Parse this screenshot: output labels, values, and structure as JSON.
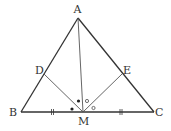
{
  "diagram": {
    "labels": {
      "A": "A",
      "B": "B",
      "C": "C",
      "D": "D",
      "E": "E",
      "M": "M"
    }
  }
}
